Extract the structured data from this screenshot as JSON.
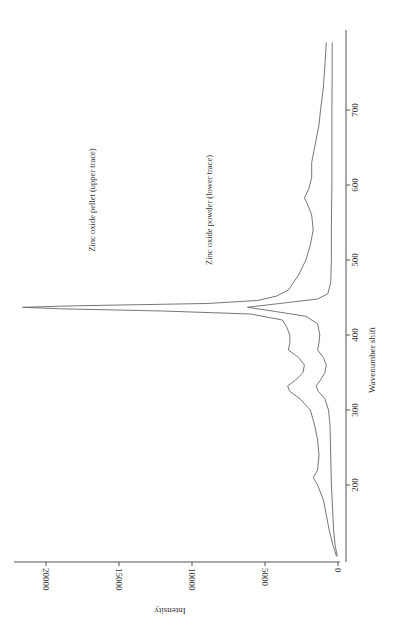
{
  "chart_data": {
    "type": "line",
    "orientation": "rotated-90-clockwise",
    "title": "",
    "xlabel": "Wavenumber shift",
    "ylabel": "Intensity",
    "xlim": [
      100,
      790
    ],
    "ylim": [
      0,
      22000
    ],
    "x_ticks": [
      200,
      300,
      400,
      500,
      600,
      700
    ],
    "y_ticks": [
      0,
      5000,
      10000,
      15000,
      20000
    ],
    "y_tick_labels": [
      "0",
      "5000",
      "10000",
      "15000",
      "20000"
    ],
    "x_tick_labels": [
      "200",
      "300",
      "400",
      "500",
      "600",
      "700"
    ],
    "grid": false,
    "annotations": [
      {
        "text": "Zinc oxide pellet (upper trace)"
      },
      {
        "text": "Zinc oxide powder (lower trace)"
      }
    ],
    "series": [
      {
        "name": "Zinc oxide pellet (upper trace)",
        "x": [
          105,
          120,
          140,
          160,
          180,
          200,
          210,
          220,
          240,
          260,
          280,
          300,
          315,
          325,
          332,
          340,
          350,
          360,
          370,
          380,
          390,
          400,
          410,
          420,
          428,
          432,
          435,
          437,
          439,
          442,
          446,
          452,
          460,
          480,
          500,
          520,
          540,
          560,
          575,
          583,
          595,
          610,
          630,
          650,
          680,
          700,
          730,
          760,
          790
        ],
        "y": [
          100,
          350,
          600,
          800,
          1000,
          1400,
          1700,
          1400,
          1300,
          1400,
          1600,
          1900,
          2600,
          3300,
          3450,
          2900,
          2400,
          2300,
          2700,
          3400,
          3300,
          3300,
          3500,
          3800,
          6000,
          12000,
          19000,
          21600,
          18000,
          9000,
          5500,
          4200,
          3400,
          2700,
          2200,
          1900,
          1700,
          1800,
          2100,
          2300,
          2000,
          1800,
          1800,
          1600,
          1300,
          1200,
          1000,
          900,
          800
        ]
      },
      {
        "name": "Zinc oxide powder (lower trace)",
        "x": [
          105,
          120,
          140,
          160,
          200,
          240,
          280,
          300,
          315,
          325,
          332,
          340,
          350,
          360,
          370,
          380,
          390,
          400,
          415,
          425,
          432,
          437,
          442,
          448,
          455,
          470,
          500,
          550,
          600,
          650,
          700,
          750,
          790
        ],
        "y": [
          50,
          200,
          300,
          350,
          450,
          500,
          550,
          650,
          900,
          1350,
          1500,
          1200,
          900,
          800,
          1000,
          1400,
          1300,
          1250,
          1400,
          2200,
          4500,
          6200,
          4000,
          1400,
          700,
          500,
          450,
          450,
          420,
          420,
          420,
          400,
          400
        ]
      }
    ]
  }
}
